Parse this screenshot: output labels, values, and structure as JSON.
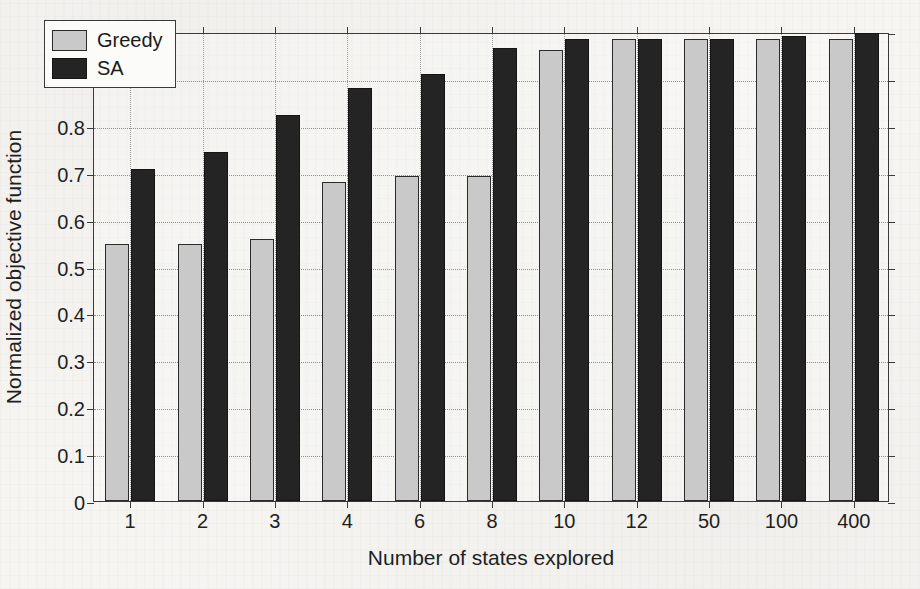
{
  "chart_data": {
    "type": "bar",
    "title": "",
    "xlabel": "Number of states explored",
    "ylabel": "Normalized objective function",
    "categories": [
      "1",
      "2",
      "3",
      "4",
      "6",
      "8",
      "10",
      "12",
      "50",
      "100",
      "400"
    ],
    "series": [
      {
        "name": "Greedy",
        "color": "#c9c9c9",
        "values": [
          0.548,
          0.548,
          0.558,
          0.68,
          0.694,
          0.693,
          0.962,
          0.986,
          0.986,
          0.985,
          0.985
        ]
      },
      {
        "name": "SA",
        "color": "#242424",
        "values": [
          0.707,
          0.745,
          0.824,
          0.881,
          0.91,
          0.966,
          0.986,
          0.986,
          0.986,
          0.992,
          0.997
        ]
      }
    ],
    "ylim": [
      0,
      1
    ],
    "yticks": [
      "0",
      "0.1",
      "0.2",
      "0.3",
      "0.4",
      "0.5",
      "0.6",
      "0.7",
      "0.8",
      "0.9",
      "1"
    ],
    "ytick_values": [
      0,
      0.1,
      0.2,
      0.3,
      0.4,
      0.5,
      0.6,
      0.7,
      0.8,
      0.9,
      1
    ],
    "grid": true,
    "legend_position": "top-left",
    "legend_entries": [
      "Greedy",
      "SA"
    ]
  }
}
